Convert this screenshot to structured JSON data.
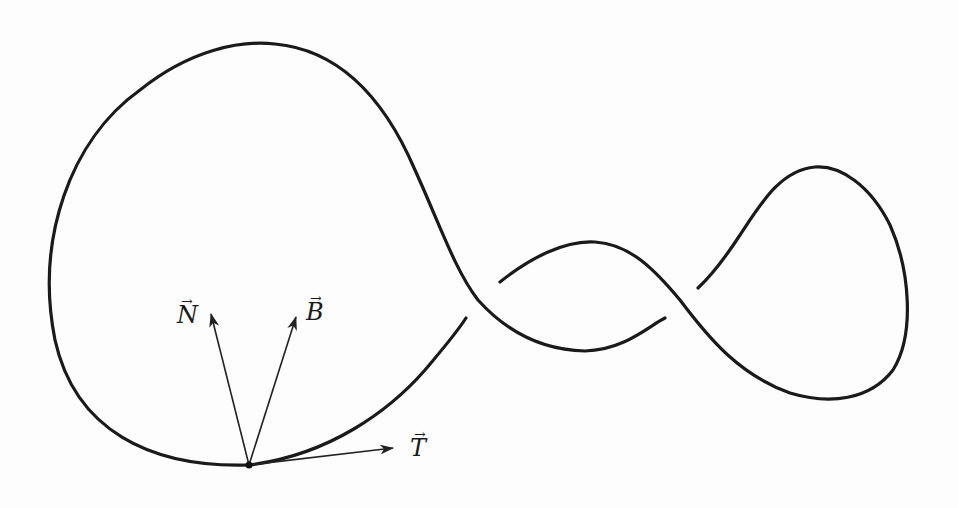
{
  "diagram": {
    "type": "knot-frenet-frame",
    "point": {
      "x": 249,
      "y": 465
    },
    "vectors": [
      {
        "name": "N",
        "label": "N",
        "arrow": "→",
        "tip": {
          "x": 211,
          "y": 313
        }
      },
      {
        "name": "B",
        "label": "B",
        "arrow": "→",
        "tip": {
          "x": 296,
          "y": 316
        }
      },
      {
        "name": "T",
        "label": "T",
        "arrow": "→",
        "tip": {
          "x": 393,
          "y": 448
        }
      }
    ],
    "colors": {
      "stroke": "#1a1a1a",
      "background": "#fdfdfd"
    }
  }
}
